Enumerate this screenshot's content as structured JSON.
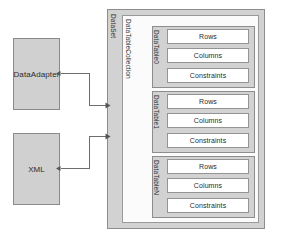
{
  "diagram": {
    "colors": {
      "container_fill": "#d2d2d2",
      "inner_fill": "#ffffff",
      "border": "#8d8d8d",
      "connector": "#6e6e6e",
      "text": "#2b2b2b",
      "page_background": "#ffffff"
    }
  },
  "sources": [
    {
      "id": "data-adapter",
      "label": "DataAdapter"
    },
    {
      "id": "xml",
      "label": "XML"
    }
  ],
  "dataset": {
    "label": "DataSet",
    "collection": {
      "label": "DataTableCollection",
      "tables": [
        {
          "id": "datatable-0",
          "label": "DataTable0",
          "fields": [
            {
              "id": "rows",
              "label": "Rows"
            },
            {
              "id": "columns",
              "label": "Columns"
            },
            {
              "id": "constraints",
              "label": "Constraints"
            }
          ]
        },
        {
          "id": "datatable-1",
          "label": "DataTable1",
          "fields": [
            {
              "id": "rows",
              "label": "Rows"
            },
            {
              "id": "columns",
              "label": "Columns"
            },
            {
              "id": "constraints",
              "label": "Constraints"
            }
          ]
        },
        {
          "id": "datatable-n",
          "label": "DataTableN",
          "fields": [
            {
              "id": "rows",
              "label": "Rows"
            },
            {
              "id": "columns",
              "label": "Columns"
            },
            {
              "id": "constraints",
              "label": "Constraints"
            }
          ]
        }
      ]
    }
  },
  "connectors": [
    {
      "id": "data-adapter-to-dataset",
      "from": "DataAdapter",
      "to": "DataSet"
    },
    {
      "id": "xml-to-dataset",
      "from": "XML",
      "to": "DataSet"
    }
  ]
}
